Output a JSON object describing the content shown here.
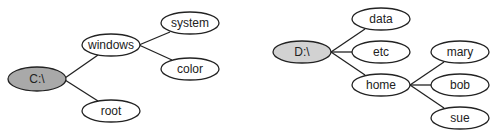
{
  "diagram": {
    "type": "directory-tree",
    "colors": {
      "root_c_fill": "#a9a9a9",
      "root_d_fill": "#d2d2d2",
      "node_fill": "#ffffff",
      "stroke": "#222222"
    },
    "trees": [
      {
        "root": "C:\\",
        "nodes": [
          {
            "id": "c_root",
            "label": "C:\\",
            "cx": 37,
            "cy": 79,
            "root": true
          },
          {
            "id": "windows",
            "label": "windows",
            "cx": 111,
            "cy": 44
          },
          {
            "id": "system",
            "label": "system",
            "cx": 190,
            "cy": 23
          },
          {
            "id": "color",
            "label": "color",
            "cx": 190,
            "cy": 69
          },
          {
            "id": "root",
            "label": "root",
            "cx": 111,
            "cy": 111
          }
        ],
        "edges": [
          [
            "c_root",
            "windows"
          ],
          [
            "c_root",
            "root"
          ],
          [
            "windows",
            "system"
          ],
          [
            "windows",
            "color"
          ]
        ]
      },
      {
        "root": "D:\\",
        "nodes": [
          {
            "id": "d_root",
            "label": "D:\\",
            "cx": 302,
            "cy": 52,
            "root": true
          },
          {
            "id": "data",
            "label": "data",
            "cx": 381,
            "cy": 19
          },
          {
            "id": "etc",
            "label": "etc",
            "cx": 381,
            "cy": 52
          },
          {
            "id": "home",
            "label": "home",
            "cx": 381,
            "cy": 85
          },
          {
            "id": "mary",
            "label": "mary",
            "cx": 460,
            "cy": 52
          },
          {
            "id": "bob",
            "label": "bob",
            "cx": 460,
            "cy": 85
          },
          {
            "id": "sue",
            "label": "sue",
            "cx": 460,
            "cy": 118
          }
        ],
        "edges": [
          [
            "d_root",
            "data"
          ],
          [
            "d_root",
            "etc"
          ],
          [
            "d_root",
            "home"
          ],
          [
            "home",
            "mary"
          ],
          [
            "home",
            "bob"
          ],
          [
            "home",
            "sue"
          ]
        ]
      }
    ]
  },
  "labels": {
    "c_root": "C:\\",
    "windows": "windows",
    "system": "system",
    "color": "color",
    "root": "root",
    "d_root": "D:\\",
    "data": "data",
    "etc": "etc",
    "home": "home",
    "mary": "mary",
    "bob": "bob",
    "sue": "sue"
  }
}
